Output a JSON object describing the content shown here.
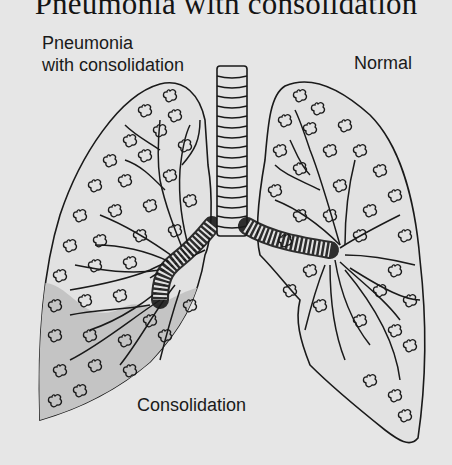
{
  "figure": {
    "title": "Pneumonia with consolidation",
    "labels": {
      "left_lung": [
        "Pneumonia",
        "with consolidation"
      ],
      "right_lung": "Normal",
      "consolidation": "Consolidation"
    },
    "colors": {
      "background": "#e6e6e6",
      "outline": "#1a1a1a",
      "consolidation_fill": "#c4c4c4"
    },
    "components": {
      "trachea": "trachea",
      "left_lung": "lung-with-pneumonia",
      "right_lung": "normal-lung",
      "consolidated_region": "lower-left-lobe-shaded"
    }
  }
}
